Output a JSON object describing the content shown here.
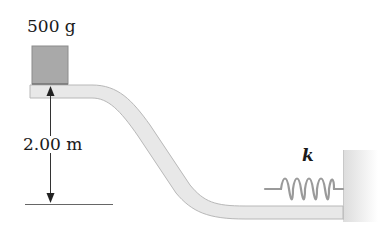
{
  "diagram": {
    "mass_label": "500 g",
    "height_label": "2.00 m",
    "spring_label": "k",
    "colors": {
      "block": "#a9a9a9",
      "track_fill": "#e8e8e8",
      "track_stroke": "#b5b5b5",
      "spring": "#9a9a9a",
      "wall": "#e0e0e0",
      "line": "#555555"
    }
  }
}
